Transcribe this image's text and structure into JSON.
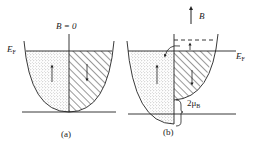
{
  "panels": [
    {
      "id": "a",
      "caption": "(a)",
      "field_label": "B = 0",
      "fermi_label": "E",
      "fermi_sub": "F",
      "left_region": "spin-up (dotted)",
      "right_region": "spin-down (hatched)"
    },
    {
      "id": "b",
      "caption": "(b)",
      "field_label": "B",
      "fermi_label": "E",
      "fermi_sub": "F",
      "splitting_label": "2μ",
      "splitting_sub": "B",
      "left_region": "spin-up (dotted)",
      "right_region": "spin-down (hatched)"
    }
  ],
  "colors": {
    "line": "#222222",
    "background": "#ffffff",
    "dots": "#888888"
  }
}
